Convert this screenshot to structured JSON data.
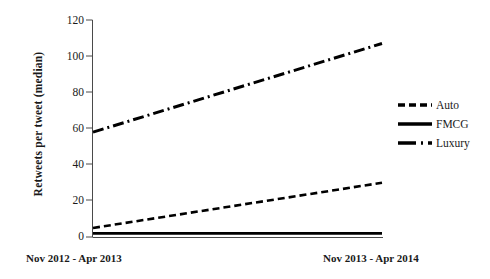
{
  "chart_data": {
    "type": "line",
    "title": "",
    "xlabel": "",
    "ylabel": "Retweets per tweet (median)",
    "categories": [
      "Nov 2012 - Apr 2013",
      "Nov 2013 - Apr 2014"
    ],
    "x": [
      0,
      1
    ],
    "ylim": [
      0,
      120
    ],
    "yticks": [
      0,
      20,
      40,
      60,
      80,
      100,
      120
    ],
    "grid": false,
    "legend_position": "right",
    "series": [
      {
        "name": "Auto",
        "values": [
          5,
          30
        ],
        "style": "dashed",
        "color": "#000000"
      },
      {
        "name": "FMCG",
        "values": [
          2,
          2
        ],
        "style": "solid",
        "color": "#000000"
      },
      {
        "name": "Luxury",
        "values": [
          58,
          107
        ],
        "style": "dashdot",
        "color": "#000000"
      }
    ]
  },
  "axes": {
    "y_title": "Retweets per tweet (median)",
    "y_ticks": [
      {
        "label": "120"
      },
      {
        "label": "100"
      },
      {
        "label": "80"
      },
      {
        "label": "60"
      },
      {
        "label": "40"
      },
      {
        "label": "20"
      },
      {
        "label": "0"
      }
    ],
    "x_ticks": [
      {
        "label": "Nov 2012 - Apr 2013"
      },
      {
        "label": "Nov 2013 - Apr 2014"
      }
    ]
  },
  "legend": {
    "items": [
      {
        "label": "Auto",
        "style": "dashed"
      },
      {
        "label": "FMCG",
        "style": "solid"
      },
      {
        "label": "Luxury",
        "style": "dashdot"
      }
    ]
  }
}
